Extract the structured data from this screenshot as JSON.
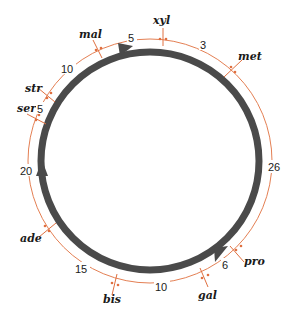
{
  "diagram": {
    "type": "circular genetic map",
    "colors": {
      "chromosome": "#4a4a4a",
      "map_line": "#e07040",
      "text": "#1a1a1a",
      "background": "#ffffff"
    },
    "genes": [
      {
        "name": "xyl"
      },
      {
        "name": "met"
      },
      {
        "name": "pro"
      },
      {
        "name": "gal"
      },
      {
        "name": "bis"
      },
      {
        "name": "ade"
      },
      {
        "name": "ser"
      },
      {
        "name": "str"
      },
      {
        "name": "mal"
      }
    ],
    "distances": [
      {
        "between": "xyl-met",
        "value": "3"
      },
      {
        "between": "met-pro",
        "value": "26"
      },
      {
        "between": "pro-gal",
        "value": "6"
      },
      {
        "between": "gal-bis",
        "value": "10"
      },
      {
        "between": "bis-ade",
        "value": "15"
      },
      {
        "between": "ade-ser",
        "value": "20"
      },
      {
        "between": "ser-str",
        "value": "5"
      },
      {
        "between": "str-mal",
        "value": "10"
      },
      {
        "between": "mal-xyl",
        "value": "5"
      }
    ]
  }
}
